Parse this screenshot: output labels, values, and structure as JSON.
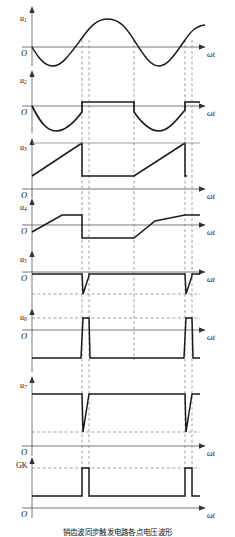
{
  "figure": {
    "axis_label": "ωt",
    "origin_label": "O",
    "caption": "销齿波同步触发电路各点电压波形"
  },
  "traces": [
    {
      "id": "u1",
      "name": "u-1",
      "label": "u",
      "sub": "1",
      "kind": "sine",
      "origin_label": "O",
      "axis_label": "ωt",
      "description": "synchronizing sinusoidal supply voltage, two full cycles, no DC offset"
    },
    {
      "id": "u2",
      "name": "u-2",
      "label": "u",
      "sub": "2",
      "kind": "clipped-sine",
      "origin_label": "O",
      "axis_label": "ωt",
      "description": "negative half-waves of sine pass, positive half-waves clipped flat at a small positive level"
    },
    {
      "id": "u3",
      "name": "u-3",
      "label": "u",
      "sub": "3",
      "kind": "sawtooth",
      "origin_label": "O",
      "axis_label": "ωt",
      "description": "rising linear ramp (sawtooth) that resets sharply at each timing mark; flat dwell between reset and next ramp"
    },
    {
      "id": "u4",
      "name": "u-4",
      "label": "u",
      "sub": "4",
      "kind": "trapezoid",
      "origin_label": "O",
      "axis_label": "ωt",
      "description": "trapezoidal shifted sawtooth riding above and below the zero axis with flat tops and flat bottoms"
    },
    {
      "id": "u5",
      "name": "u-5",
      "label": "u",
      "sub": "5",
      "kind": "negative-spike",
      "origin_label": "O",
      "axis_label": "ωt",
      "description": "held near zero, then a sharp negative spike followed by a linear recovery back to zero at each trigger instant"
    },
    {
      "id": "u6",
      "name": "u-6",
      "label": "u",
      "sub": "6",
      "kind": "pulse",
      "origin_label": "O",
      "axis_label": "ωt",
      "description": "normally held at a negative level, jumps to a positive level for a narrow interval at each trigger instant"
    },
    {
      "id": "u7",
      "name": "u-7",
      "label": "u",
      "sub": "7",
      "kind": "ramp-drop",
      "origin_label": "O",
      "axis_label": "ωt",
      "description": "held high, drops steeply to a low level then ramps linearly back up to the high level at each trigger instant"
    },
    {
      "id": "gk",
      "name": "gate-cathode",
      "label": "GK",
      "sub": "",
      "kind": "gate-pulse",
      "origin_label": "O",
      "axis_label": "ωt",
      "description": "gate–cathode trigger output: two narrow rectangular gate pulses, one per cycle"
    }
  ],
  "timing": {
    "marks_label": "dashed vertical timing reference lines",
    "mark_count": 6,
    "pairs": 2,
    "description": "paired dashed lines mark the pulse leading and trailing edges; single dashed lines mark the sawtooth reset instants"
  },
  "colors": {
    "curve": "#1a1a1a",
    "axis": "#4d4d4d",
    "dashed": "#8c8c8c",
    "background": "#ffffff"
  }
}
